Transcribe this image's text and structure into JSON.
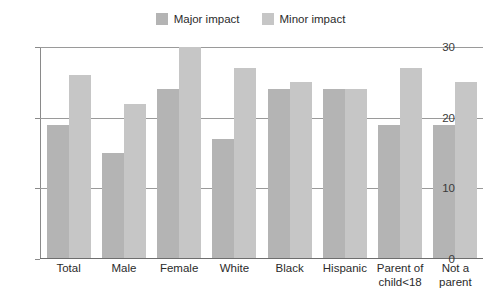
{
  "chart_data": {
    "type": "bar",
    "title": "",
    "subtitle": "",
    "xlabel": "",
    "ylabel": "",
    "ylim": [
      0,
      30
    ],
    "yticks": [
      0,
      10,
      20,
      30
    ],
    "ytick_labels": [
      "0",
      "10",
      "20",
      "30"
    ],
    "grid": true,
    "legend_position": "top-center",
    "categories": [
      "Total",
      "Male",
      "Female",
      "White",
      "Black",
      "Hispanic",
      "Parent of child<18",
      "Not a parent"
    ],
    "category_lines": [
      [
        "Total"
      ],
      [
        "Male"
      ],
      [
        "Female"
      ],
      [
        "White"
      ],
      [
        "Black"
      ],
      [
        "Hispanic"
      ],
      [
        "Parent of",
        "child<18"
      ],
      [
        "Not a",
        "parent"
      ]
    ],
    "series": [
      {
        "name": "Major impact",
        "color": "#b4b4b4",
        "values": [
          19,
          15,
          24,
          17,
          24,
          24,
          19,
          19
        ]
      },
      {
        "name": "Minor impact",
        "color": "#c6c6c6",
        "values": [
          26,
          22,
          30,
          27,
          25,
          24,
          27,
          25
        ]
      }
    ]
  },
  "legend": {
    "entries": [
      {
        "label": "Major impact",
        "color": "#b4b4b4"
      },
      {
        "label": "Minor impact",
        "color": "#c6c6c6"
      }
    ]
  },
  "axis": {
    "y_labels": [
      "30",
      "20",
      "10",
      "0"
    ],
    "axis_color": "#8a8a8a",
    "gridline_color": "#9a9a9a"
  }
}
